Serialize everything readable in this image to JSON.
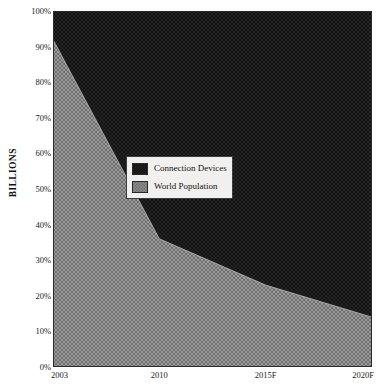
{
  "chart_data": {
    "type": "area",
    "stacked": true,
    "title": "",
    "subtitle": "",
    "xlabel": "",
    "ylabel": "BILLIONS",
    "categories": [
      "2003",
      "2010",
      "2015F",
      "2020F"
    ],
    "x_tick_labels": [
      "2003",
      "2010",
      "2015F",
      "2020F"
    ],
    "y_tick_labels": [
      "0%",
      "10%",
      "20%",
      "30%",
      "40%",
      "50%",
      "60%",
      "70%",
      "80%",
      "90%",
      "100%"
    ],
    "y_tick_values": [
      0,
      10,
      20,
      30,
      40,
      50,
      60,
      70,
      80,
      90,
      100
    ],
    "ylim": [
      0,
      100
    ],
    "grid": false,
    "legend_position": "center-left-inside",
    "series": [
      {
        "name": "Connection Devices",
        "color": "#141414",
        "values": [
          8,
          64,
          77,
          86
        ]
      },
      {
        "name": "World Population",
        "color": "#8a8a8a",
        "values": [
          92,
          36,
          23,
          14
        ]
      }
    ],
    "boundary_percent": [
      92,
      36,
      23,
      14
    ],
    "annotations": []
  },
  "legend": {
    "items": [
      {
        "label": "Connection Devices",
        "swatch": "dark-dither-swatch"
      },
      {
        "label": "World Population",
        "swatch": "gray-dither-swatch"
      }
    ]
  },
  "axes": {
    "y_title": "BILLIONS"
  },
  "colors": {
    "devices_fill": "#141414",
    "population_fill": "#8a8a8a",
    "axis_line": "#2a2a2a",
    "legend_background": "#f2f0ee",
    "legend_border": "#3c3c3c",
    "page_background": "#ffffff"
  }
}
